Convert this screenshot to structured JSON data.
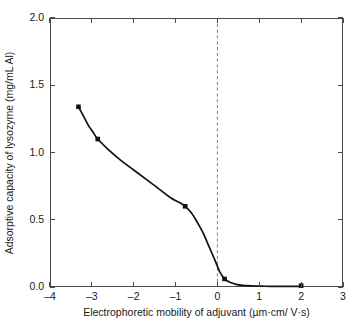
{
  "chart_data": {
    "type": "line",
    "title": "",
    "xlabel": "Electrophoretic mobility of adjuvant (µm·cm/ V·s)",
    "ylabel": "Adsorptive capacity of lysozyme (mg/mL Al)",
    "xlim": [
      -4,
      3
    ],
    "ylim": [
      0.0,
      2.0
    ],
    "xticks": [
      -4,
      -3,
      -2,
      -1,
      0,
      1,
      2,
      3
    ],
    "xticklabels": [
      "–4",
      "–3",
      "–2",
      "–1",
      "0",
      "1",
      "2",
      "3"
    ],
    "yticks": [
      0.0,
      0.5,
      1.0,
      1.5,
      2.0
    ],
    "yticklabels": [
      "0.0",
      "0.5",
      "1.0",
      "1.5",
      "2.0"
    ],
    "grid": false,
    "legend": null,
    "series": [
      {
        "name": "Lysozyme adsorption vs adjuvant mobility",
        "marker": "square",
        "marker_color": "#111111",
        "line_color": "#111111",
        "x": [
          -3.32,
          -2.86,
          -0.77,
          0.17,
          2.0
        ],
        "y": [
          1.34,
          1.1,
          0.6,
          0.06,
          0.01
        ]
      }
    ],
    "curve_points": {
      "x": [
        -3.32,
        -3.2,
        -3.08,
        -2.97,
        -2.86,
        -2.6,
        -2.3,
        -2.0,
        -1.7,
        -1.4,
        -1.1,
        -0.92,
        -0.77,
        -0.62,
        -0.48,
        -0.34,
        -0.2,
        -0.06,
        0.06,
        0.17,
        0.3,
        0.45,
        0.6,
        0.8,
        1.05,
        1.3,
        1.6,
        2.0
      ],
      "y": [
        1.34,
        1.27,
        1.2,
        1.15,
        1.1,
        1.02,
        0.94,
        0.87,
        0.8,
        0.73,
        0.66,
        0.63,
        0.6,
        0.55,
        0.48,
        0.4,
        0.3,
        0.2,
        0.11,
        0.06,
        0.035,
        0.02,
        0.012,
        0.008,
        0.006,
        0.005,
        0.005,
        0.005
      ]
    },
    "annotations": [
      {
        "type": "vertical-dashed-line",
        "x": 0,
        "color": "#8c8c8c",
        "label": "isoelectric point reference"
      }
    ],
    "axis_color": "#4a4a4a",
    "background_color": "#ffffff"
  }
}
